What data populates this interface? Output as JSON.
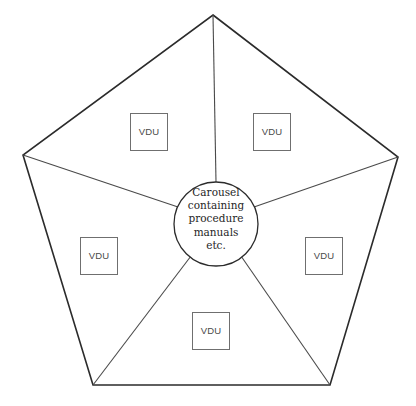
{
  "diagram": {
    "shape": "pentagon",
    "stroke_color": "#2b2b2b",
    "spoke_color": "#4a4a4a",
    "box_border_color": "#6f6f6f",
    "background_color": "#ffffff",
    "hub": {
      "name": "carousel-hub",
      "shape": "circle",
      "center_x": 216,
      "center_y": 224,
      "radius": 42,
      "lines": [
        "Carousel",
        "containing",
        "procedure",
        "manuals",
        "etc."
      ]
    },
    "pentagon_points": "213,15 398,157 330,385 93,385 23,155",
    "vertices": [
      {
        "name": "apex-top",
        "x": 213,
        "y": 15
      },
      {
        "name": "vertex-right",
        "x": 398,
        "y": 157
      },
      {
        "name": "vertex-bottom-right",
        "x": 330,
        "y": 385
      },
      {
        "name": "vertex-bottom-left",
        "x": 93,
        "y": 385
      },
      {
        "name": "vertex-left",
        "x": 23,
        "y": 155
      }
    ],
    "spokes": [
      {
        "name": "spoke-top",
        "x1": 216,
        "y1": 182,
        "x2": 213,
        "y2": 15
      },
      {
        "name": "spoke-right",
        "x1": 254,
        "y1": 207,
        "x2": 398,
        "y2": 157
      },
      {
        "name": "spoke-bottom-right",
        "x1": 241,
        "y1": 256,
        "x2": 330,
        "y2": 385
      },
      {
        "name": "spoke-bottom-left",
        "x1": 191,
        "y1": 256,
        "x2": 93,
        "y2": 385
      },
      {
        "name": "spoke-left",
        "x1": 178,
        "y1": 207,
        "x2": 23,
        "y2": 155
      }
    ],
    "nodes": [
      {
        "name": "vdu-top-left",
        "label": "VDU",
        "x": 130,
        "y": 113
      },
      {
        "name": "vdu-top-right",
        "label": "VDU",
        "x": 253,
        "y": 113
      },
      {
        "name": "vdu-left",
        "label": "VDU",
        "x": 80,
        "y": 237
      },
      {
        "name": "vdu-right",
        "label": "VDU",
        "x": 305,
        "y": 237
      },
      {
        "name": "vdu-bottom",
        "label": "VDU",
        "x": 192,
        "y": 312
      }
    ]
  }
}
